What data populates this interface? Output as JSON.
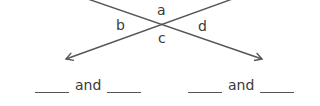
{
  "diagram": {
    "type": "intersecting-lines",
    "angle_labels": {
      "top": "a",
      "left": "b",
      "bottom": "c",
      "right": "d"
    },
    "line_color": "#555555"
  },
  "answers": [
    {
      "connector": "and"
    },
    {
      "connector": "and"
    }
  ]
}
